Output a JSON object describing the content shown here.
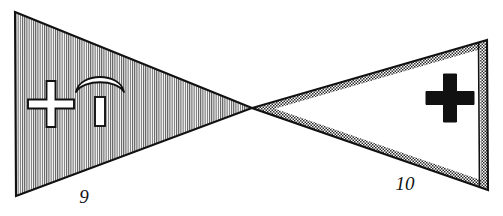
{
  "figure": {
    "background_color": "#ffffff",
    "ink_color": "#111111",
    "width": 503,
    "height": 216,
    "shapes": [
      {
        "id": "left-pennant",
        "name": "left-pennant",
        "label": "9",
        "label_x": 84,
        "label_y": 203,
        "fill_style": "vertical-hatching",
        "fill_color": "#ffffff",
        "hatch_color": "#555555",
        "outline_color": "#111111",
        "points": "15,12 252,108 16,196",
        "emblems": [
          {
            "id": "left-cross",
            "name": "outlined-cross-emblem",
            "style": "white-fill-black-outline",
            "fill": "#ffffff",
            "stroke": "#111111",
            "cx": 51,
            "cy": 104,
            "arm_length": 23,
            "arm_width": 9
          },
          {
            "id": "left-pickaxe",
            "name": "pickaxe-emblem",
            "style": "white-fill-black-outline",
            "fill": "#ffffff",
            "stroke": "#111111",
            "head_cx": 100,
            "head_cy": 85,
            "handle_x": 95,
            "handle_y": 97,
            "handle_w": 10,
            "handle_h": 29
          }
        ]
      },
      {
        "id": "right-pennant",
        "name": "right-pennant",
        "label": "10",
        "label_x": 405,
        "label_y": 190,
        "fill_style": "stippled-border-band",
        "fill_color": "#ffffff",
        "band_color": "#6e6e6e",
        "outline_color": "#111111",
        "points": "487,40 252,108 488,190",
        "band_width": 7,
        "emblems": [
          {
            "id": "right-cross",
            "name": "solid-cross-emblem",
            "style": "solid-black",
            "fill": "#111111",
            "cx": 450,
            "cy": 98,
            "arm_length": 24,
            "arm_width": 13
          }
        ]
      }
    ]
  }
}
